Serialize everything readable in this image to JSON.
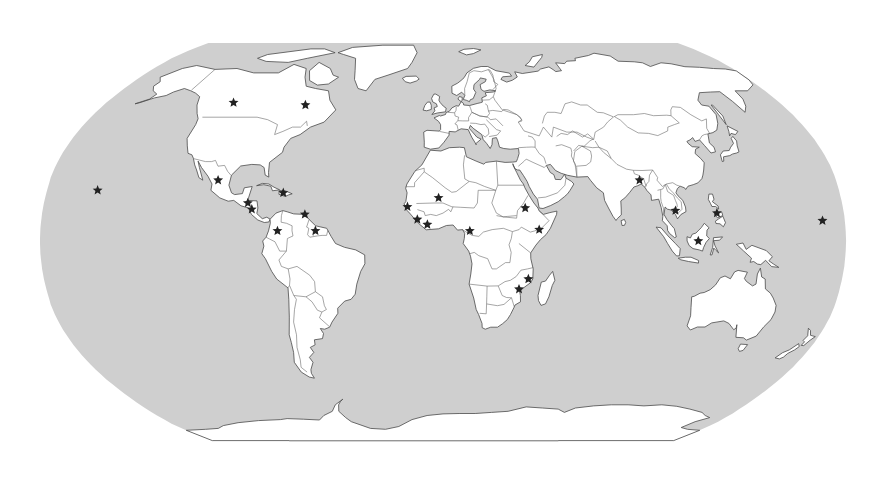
{
  "map": {
    "projection": "robinson",
    "colors": {
      "ocean": "#cfcfcf",
      "land": "#ffffff",
      "coastline": "#4a4a4a",
      "marker": "#222222"
    },
    "marker_icon": "star-icon",
    "markers": [
      {
        "name": "hawaii",
        "lon": -157,
        "lat": 20
      },
      {
        "name": "western-canada",
        "lon": -112,
        "lat": 55
      },
      {
        "name": "quebec",
        "lon": -73,
        "lat": 54
      },
      {
        "name": "mexico",
        "lon": -103,
        "lat": 24
      },
      {
        "name": "haiti",
        "lon": -72.5,
        "lat": 19
      },
      {
        "name": "guatemala-honduras",
        "lon": -88,
        "lat": 15
      },
      {
        "name": "nicaragua",
        "lon": -86,
        "lat": 12.5
      },
      {
        "name": "venezuela-trinidad",
        "lon": -62,
        "lat": 10.5
      },
      {
        "name": "colombia",
        "lon": -74,
        "lat": 4
      },
      {
        "name": "guyana",
        "lon": -57,
        "lat": 4
      },
      {
        "name": "mali",
        "lon": -2,
        "lat": 17
      },
      {
        "name": "senegal-gambia",
        "lon": -16,
        "lat": 13.5
      },
      {
        "name": "sierra-leone",
        "lon": -11.5,
        "lat": 8.5
      },
      {
        "name": "liberia-cote-divoire",
        "lon": -7,
        "lat": 6.5
      },
      {
        "name": "cameroon",
        "lon": 12,
        "lat": 4
      },
      {
        "name": "ethiopia-sudan",
        "lon": 37,
        "lat": 13
      },
      {
        "name": "somalia",
        "lon": 43,
        "lat": 4.5
      },
      {
        "name": "mozambique-north",
        "lon": 38.5,
        "lat": -15
      },
      {
        "name": "mozambique",
        "lon": 34.5,
        "lat": -19
      },
      {
        "name": "bangladesh",
        "lon": 90,
        "lat": 24
      },
      {
        "name": "cambodia",
        "lon": 104.5,
        "lat": 12
      },
      {
        "name": "philippines",
        "lon": 123,
        "lat": 11
      },
      {
        "name": "borneo",
        "lon": 114,
        "lat": 0
      },
      {
        "name": "marshall-islands",
        "lon": 170,
        "lat": 8
      }
    ]
  }
}
